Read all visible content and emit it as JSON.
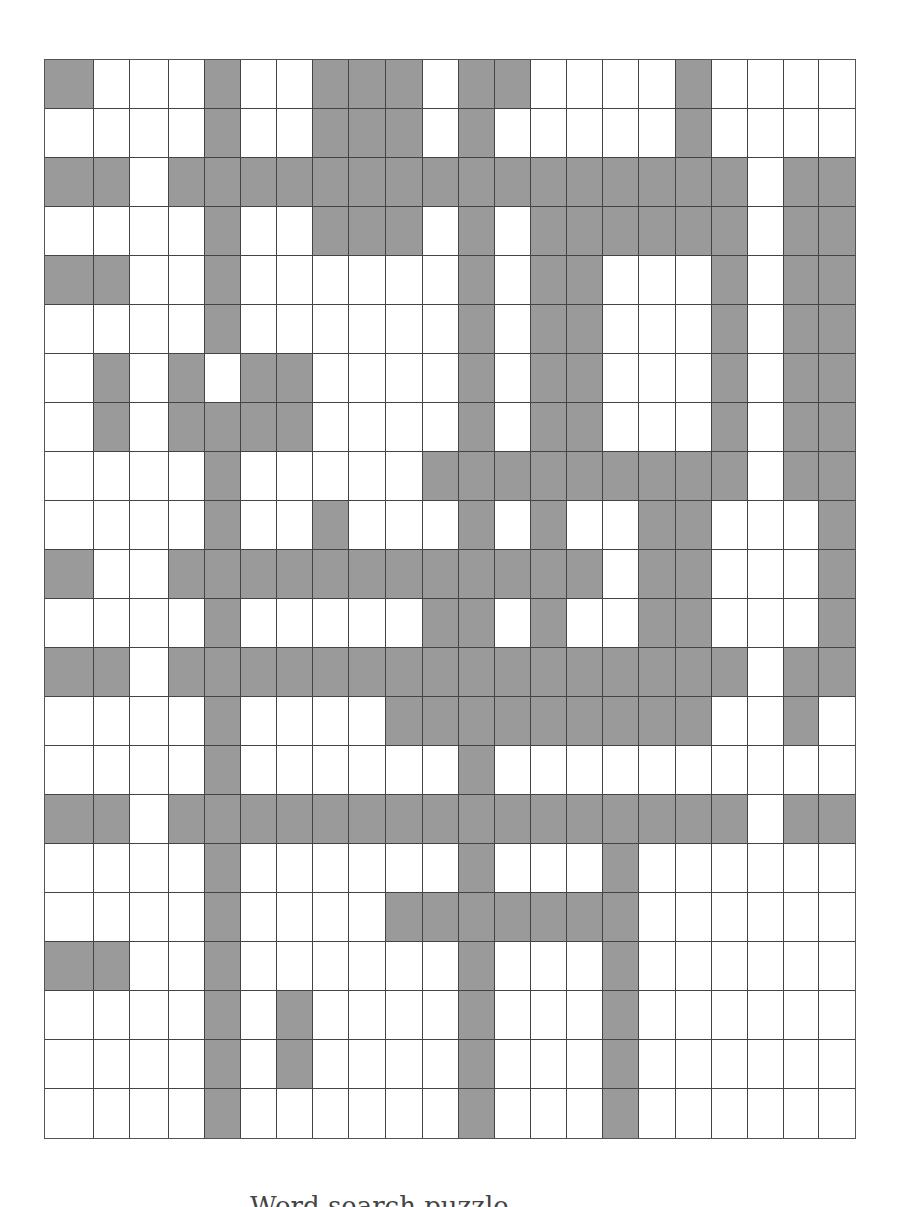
{
  "captions": {
    "top": "",
    "bottom": "Word search puzzle"
  },
  "grid": {
    "columns": 22,
    "rows": 22,
    "column_widths_px": [
      49,
      36,
      39,
      36,
      36,
      36,
      36,
      36,
      37,
      37,
      36,
      36,
      36,
      36,
      36,
      36,
      37,
      36,
      36,
      36,
      35,
      36
    ],
    "row_height_px": 49,
    "colors": {
      "shaded": "#9a9a9a",
      "empty": "#ffffff",
      "line": "#444444"
    },
    "shaded_cells": [
      [
        0,
        4,
        7,
        8,
        9,
        11,
        12,
        17
      ],
      [
        4,
        7,
        8,
        9,
        11,
        17
      ],
      [
        0,
        1,
        3,
        4,
        5,
        6,
        7,
        8,
        9,
        10,
        11,
        12,
        13,
        14,
        15,
        16,
        17,
        18,
        20,
        21
      ],
      [
        4,
        7,
        8,
        9,
        11,
        13,
        14,
        15,
        16,
        17,
        18,
        20,
        21
      ],
      [
        0,
        1,
        4,
        11,
        13,
        14,
        18,
        20,
        21
      ],
      [
        4,
        11,
        13,
        14,
        18,
        20,
        21
      ],
      [
        1,
        3,
        5,
        6,
        11,
        13,
        14,
        18,
        20,
        21
      ],
      [
        1,
        3,
        4,
        5,
        6,
        11,
        13,
        14,
        18,
        20,
        21
      ],
      [
        4,
        10,
        11,
        12,
        13,
        14,
        15,
        16,
        17,
        18,
        20,
        21
      ],
      [
        4,
        7,
        11,
        13,
        16,
        17,
        21
      ],
      [
        0,
        3,
        4,
        5,
        6,
        7,
        8,
        9,
        10,
        11,
        12,
        13,
        14,
        16,
        17,
        21
      ],
      [
        4,
        10,
        11,
        13,
        16,
        17,
        21
      ],
      [
        0,
        1,
        3,
        4,
        5,
        6,
        7,
        8,
        9,
        10,
        11,
        12,
        13,
        14,
        15,
        16,
        17,
        18,
        20,
        21
      ],
      [
        4,
        9,
        10,
        11,
        12,
        13,
        14,
        15,
        16,
        17,
        20
      ],
      [
        4,
        11
      ],
      [
        0,
        1,
        3,
        4,
        5,
        6,
        7,
        8,
        9,
        10,
        11,
        12,
        13,
        14,
        15,
        16,
        17,
        18,
        20,
        21
      ],
      [
        4,
        11,
        15
      ],
      [
        4,
        9,
        10,
        11,
        12,
        13,
        14,
        15
      ],
      [
        0,
        1,
        4,
        11,
        15
      ],
      [
        4,
        6,
        11,
        15
      ],
      [
        4,
        6,
        11,
        15
      ],
      [
        4,
        11,
        15
      ]
    ]
  }
}
